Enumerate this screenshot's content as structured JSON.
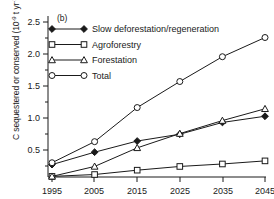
{
  "panel_label": "(b)",
  "axis": {
    "ylabel_main": "C sequestered or conserved (10",
    "ylabel_sup1": "-9",
    "ylabel_mid": " t yr",
    "ylabel_sup2": "-1",
    "ylabel_end": ")",
    "ylabel_full": "C sequestered or conserved (10-9 t yr-1)",
    "yticks": [
      "0.5",
      "1.0",
      "1.5",
      "2.0",
      "2.5"
    ],
    "xticks": [
      "1995",
      "2005",
      "2015",
      "2025",
      "2035",
      "2045"
    ]
  },
  "legend": {
    "items": [
      {
        "label": "Slow deforestation/regeneration",
        "marker": "filled-diamond"
      },
      {
        "label": "Agroforestry",
        "marker": "open-square"
      },
      {
        "label": "Forestation",
        "marker": "open-triangle"
      },
      {
        "label": "Total",
        "marker": "open-circle"
      }
    ]
  },
  "colors": {
    "line": "#1a1a1a",
    "marker_fill_open": "#ffffff",
    "marker_fill_closed": "#1a1a1a",
    "background": "#ffffff"
  },
  "chart_data": {
    "type": "line",
    "title": "(b)",
    "xlabel": "",
    "ylabel": "C sequestered or conserved (10-9 t yr-1)",
    "x": [
      1995,
      2005,
      2015,
      2025,
      2035,
      2045
    ],
    "xlim": [
      1995,
      2045
    ],
    "ylim": [
      0,
      2.6
    ],
    "grid": false,
    "legend_position": "upper-left",
    "series": [
      {
        "name": "Slow deforestation/regeneration",
        "marker": "filled-diamond",
        "values": [
          0.2,
          0.4,
          0.58,
          0.69,
          0.88,
          0.98
        ]
      },
      {
        "name": "Agroforestry",
        "marker": "open-square",
        "values": [
          0.01,
          0.04,
          0.11,
          0.17,
          0.21,
          0.26
        ]
      },
      {
        "name": "Forestation",
        "marker": "open-triangle",
        "values": [
          0.01,
          0.17,
          0.47,
          0.7,
          0.91,
          1.1
        ]
      },
      {
        "name": "Total",
        "marker": "open-circle",
        "values": [
          0.23,
          0.57,
          1.12,
          1.54,
          1.94,
          2.25
        ]
      }
    ]
  }
}
